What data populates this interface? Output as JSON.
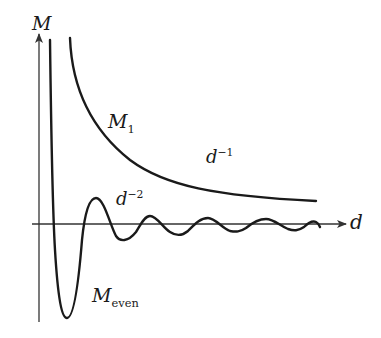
{
  "figure": {
    "type": "schematic",
    "axes": {
      "y_label": "M",
      "x_label": "d"
    },
    "curves": [
      {
        "name": "M_1",
        "label_main": "M",
        "label_sub": "1",
        "decay_label_base": "d",
        "decay_label_exp": "−1",
        "behavior": "monotonic decay",
        "color": "#1a1a1a"
      },
      {
        "name": "M_even",
        "label_main": "M",
        "label_sub": "even",
        "decay_label_base": "d",
        "decay_label_exp": "−2",
        "behavior": "damped oscillation",
        "color": "#1a1a1a"
      }
    ]
  },
  "colors": {
    "axis": "#333333",
    "curve": "#1a1a1a",
    "background": "#ffffff"
  }
}
